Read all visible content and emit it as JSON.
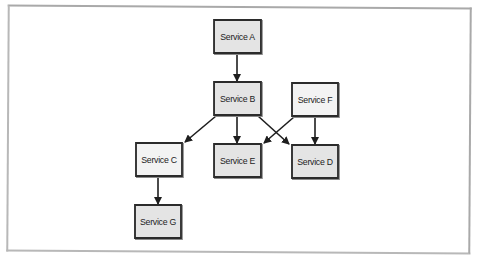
{
  "diagram": {
    "type": "service-dependency-graph",
    "frame": {
      "border_color": "#b0b0b0"
    },
    "colors": {
      "node_fill_dark": "#e4e4e4",
      "node_fill_light": "#f3f3f3",
      "node_border": "#2b2b2b",
      "edge": "#1e1e1e"
    },
    "nodes": [
      {
        "id": "A",
        "label": "Service A",
        "x": 211,
        "y": 19,
        "w": 53,
        "h": 35,
        "fill": "#e4e4e4"
      },
      {
        "id": "B",
        "label": "Service B",
        "x": 211,
        "y": 81,
        "w": 53,
        "h": 35,
        "fill": "#e4e4e4"
      },
      {
        "id": "F",
        "label": "Service F",
        "x": 289,
        "y": 82,
        "w": 52,
        "h": 35,
        "fill": "#f3f3f3"
      },
      {
        "id": "C",
        "label": "Service C",
        "x": 133,
        "y": 142,
        "w": 52,
        "h": 35,
        "fill": "#f3f3f3"
      },
      {
        "id": "E",
        "label": "Service E",
        "x": 211,
        "y": 143,
        "w": 53,
        "h": 35,
        "fill": "#e4e4e4"
      },
      {
        "id": "D",
        "label": "Service D",
        "x": 289,
        "y": 144,
        "w": 52,
        "h": 35,
        "fill": "#e4e4e4"
      },
      {
        "id": "G",
        "label": "Service G",
        "x": 132,
        "y": 204,
        "w": 52,
        "h": 35,
        "fill": "#e4e4e4"
      }
    ],
    "edges": [
      {
        "from": "Service A",
        "to": "Service B",
        "x1": 237,
        "y1": 54,
        "x2": 237,
        "y2": 81
      },
      {
        "from": "Service B",
        "to": "Service C",
        "x1": 216,
        "y1": 116,
        "x2": 185,
        "y2": 142
      },
      {
        "from": "Service B",
        "to": "Service E",
        "x1": 237,
        "y1": 116,
        "x2": 237,
        "y2": 143
      },
      {
        "from": "Service B",
        "to": "Service D",
        "x1": 258,
        "y1": 116,
        "x2": 289,
        "y2": 144
      },
      {
        "from": "Service F",
        "to": "Service E",
        "x1": 294,
        "y1": 117,
        "x2": 264,
        "y2": 143
      },
      {
        "from": "Service F",
        "to": "Service D",
        "x1": 315,
        "y1": 117,
        "x2": 315,
        "y2": 144
      },
      {
        "from": "Service C",
        "to": "Service G",
        "x1": 158,
        "y1": 177,
        "x2": 158,
        "y2": 204
      }
    ]
  }
}
